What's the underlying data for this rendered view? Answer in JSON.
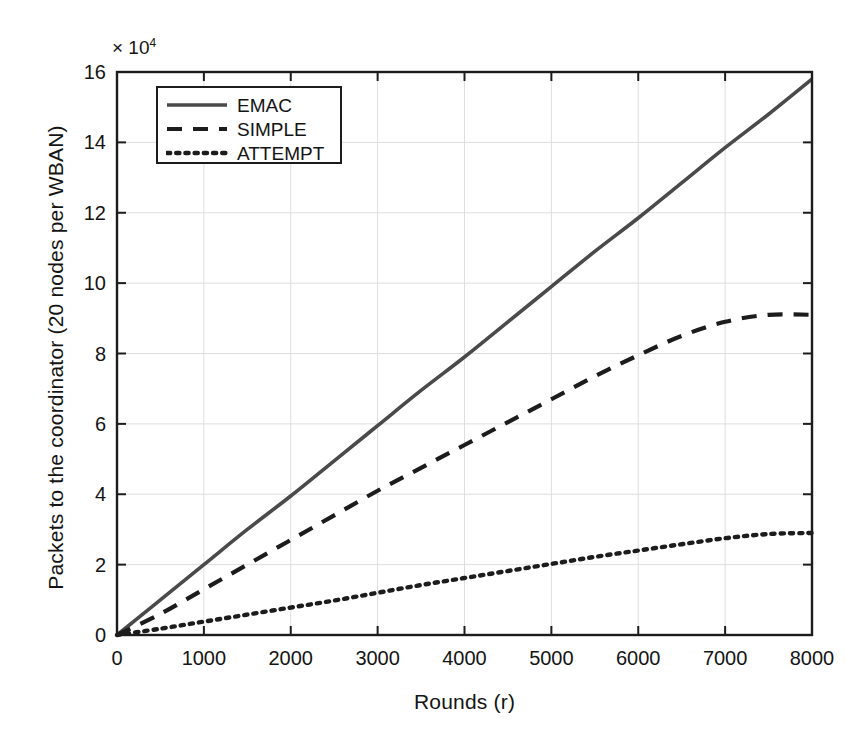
{
  "figure": {
    "background_color": "#ffffff",
    "axis_color": "#1c1c1c",
    "grid_color": "#dedede"
  },
  "axes": {
    "y_exponent_prefix": "× 10",
    "y_exponent_power": "4",
    "y_label": "Packets to the coordinator (20 nodes per WBAN)",
    "x_label": "Rounds (r)",
    "y_ticks": [
      "0",
      "2",
      "4",
      "6",
      "8",
      "10",
      "12",
      "14",
      "16"
    ],
    "x_ticks": [
      "0",
      "1000",
      "2000",
      "3000",
      "4000",
      "5000",
      "6000",
      "7000",
      "8000"
    ]
  },
  "legend": {
    "entries": [
      {
        "label": "EMAC",
        "style": "solid",
        "color": "#4a4a4a"
      },
      {
        "label": "SIMPLE",
        "style": "dashed",
        "color": "#1c1c1c"
      },
      {
        "label": "ATTEMPT",
        "style": "dotted",
        "color": "#1c1c1c"
      }
    ]
  },
  "chart_data": {
    "type": "line",
    "title": "",
    "xlabel": "Rounds (r)",
    "ylabel": "Packets to the coordinator (20 nodes per WBAN)",
    "y_multiplier": 10000,
    "xlim": [
      0,
      8000
    ],
    "ylim": [
      0,
      16
    ],
    "grid": true,
    "legend_position": "upper-left-inside",
    "x": [
      0,
      500,
      1000,
      1500,
      2000,
      2500,
      3000,
      3500,
      4000,
      4500,
      5000,
      5500,
      6000,
      6500,
      7000,
      7500,
      8000
    ],
    "series": [
      {
        "name": "EMAC",
        "style": "solid",
        "color": "#4a4a4a",
        "values": [
          0.0,
          1.0,
          2.0,
          3.0,
          3.95,
          4.95,
          5.95,
          6.95,
          7.9,
          8.9,
          9.9,
          10.9,
          11.85,
          12.85,
          13.85,
          14.8,
          15.8
        ]
      },
      {
        "name": "SIMPLE",
        "style": "dashed",
        "color": "#1c1c1c",
        "values": [
          0.0,
          0.6,
          1.3,
          2.0,
          2.7,
          3.4,
          4.1,
          4.75,
          5.4,
          6.05,
          6.7,
          7.35,
          7.95,
          8.5,
          8.9,
          9.1,
          9.1
        ]
      },
      {
        "name": "ATTEMPT",
        "style": "dotted",
        "color": "#1c1c1c",
        "values": [
          0.0,
          0.18,
          0.38,
          0.58,
          0.78,
          0.98,
          1.2,
          1.42,
          1.62,
          1.82,
          2.02,
          2.22,
          2.4,
          2.58,
          2.75,
          2.87,
          2.9
        ]
      }
    ]
  }
}
